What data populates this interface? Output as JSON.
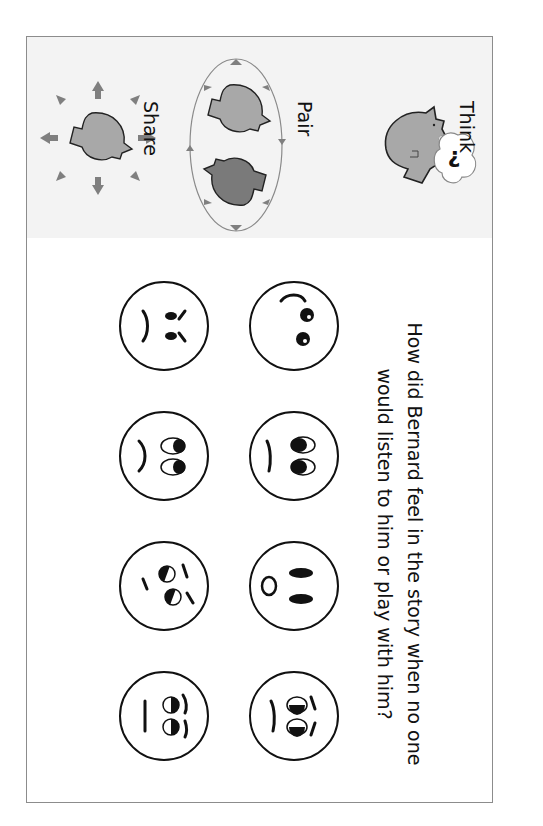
{
  "worksheet": {
    "strategy": {
      "steps": [
        {
          "label": "Think",
          "icon": "thinking-head-icon"
        },
        {
          "label": "Pair",
          "icon": "pair-heads-cycle-icon"
        },
        {
          "label": "Share",
          "icon": "sharing-head-icon"
        }
      ],
      "think_bubble_glyph": "?"
    },
    "question": {
      "line1": "How did Bernard feel in the story when no one",
      "line2": "would listen to him or play with him?"
    },
    "faces": [
      {
        "emotion": "happy"
      },
      {
        "emotion": "sad"
      },
      {
        "emotion": "surprised"
      },
      {
        "emotion": "worried"
      },
      {
        "emotion": "angry"
      },
      {
        "emotion": "upset"
      },
      {
        "emotion": "confused"
      },
      {
        "emotion": "neutral"
      }
    ],
    "colors": {
      "frame_border": "#8c8c8c",
      "banner_bg": "#f3f3f3",
      "head_fill": "#a8a8a8",
      "head_dark_fill": "#7a7a7a",
      "arrow": "#7f7f7f"
    }
  }
}
